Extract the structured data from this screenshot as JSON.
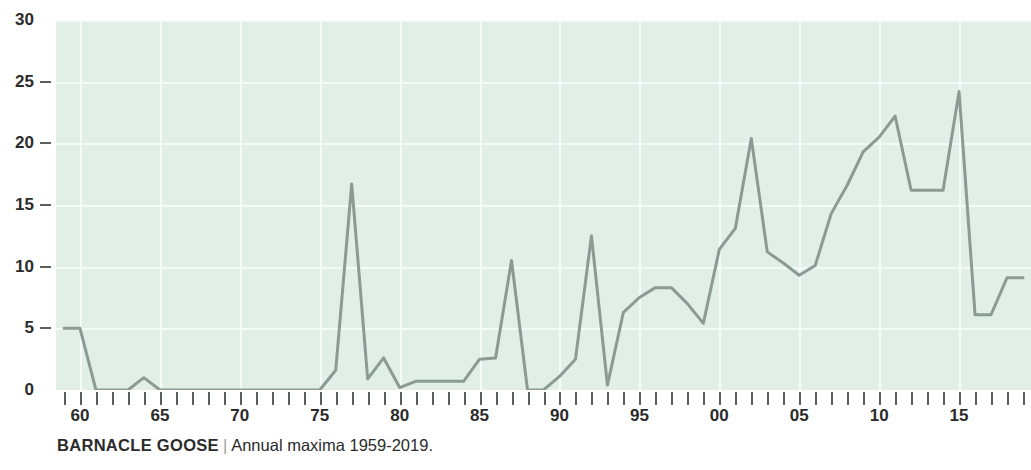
{
  "caption": {
    "species": "BARNACLE GOOSE",
    "separator": "|",
    "description": "Annual maxima 1959-2019."
  },
  "colors": {
    "plot_background": "#e1efe7",
    "gridline": "#f4faf6",
    "series_line": "#8b9b94",
    "axis_text": "#2b2b2b",
    "tick_mark": "#5a615d",
    "page_background": "#ffffff"
  },
  "chart_data": {
    "type": "line",
    "title": "BARNACLE GOOSE",
    "subtitle": "Annual maxima 1959-2019.",
    "xlabel": "",
    "ylabel": "",
    "xlim": [
      1958.5,
      2019.5
    ],
    "ylim": [
      0,
      30
    ],
    "yticks": [
      0,
      5,
      10,
      15,
      20,
      25,
      30
    ],
    "ytick_labels": [
      "0",
      "5",
      "10",
      "15",
      "20",
      "25",
      "30"
    ],
    "xticks": [
      1960,
      1965,
      1970,
      1975,
      1980,
      1985,
      1990,
      1995,
      2000,
      2005,
      2010,
      2015
    ],
    "xtick_labels": [
      "60",
      "65",
      "70",
      "75",
      "80",
      "85",
      "90",
      "95",
      "00",
      "05",
      "10",
      "15"
    ],
    "xtick_minor_every": 1,
    "grid": true,
    "grid_axis": "both",
    "legend": false,
    "legend_position": "none",
    "x": [
      1959,
      1960,
      1961,
      1962,
      1963,
      1964,
      1965,
      1966,
      1967,
      1968,
      1969,
      1970,
      1971,
      1972,
      1973,
      1974,
      1975,
      1976,
      1977,
      1978,
      1979,
      1980,
      1981,
      1982,
      1983,
      1984,
      1985,
      1986,
      1987,
      1988,
      1989,
      1990,
      1991,
      1992,
      1993,
      1994,
      1995,
      1996,
      1997,
      1998,
      1999,
      2000,
      2001,
      2002,
      2003,
      2004,
      2005,
      2006,
      2007,
      2008,
      2009,
      2010,
      2011,
      2012,
      2013,
      2014,
      2015,
      2016,
      2017,
      2018,
      2019
    ],
    "values": [
      5.0,
      5.0,
      0.0,
      0.0,
      0.0,
      1.0,
      0.0,
      0.0,
      0.0,
      0.0,
      0.0,
      0.0,
      0.0,
      0.0,
      0.0,
      0.0,
      0.0,
      1.6,
      16.7,
      0.9,
      2.6,
      0.2,
      0.7,
      0.7,
      0.7,
      0.7,
      2.5,
      2.6,
      10.5,
      0.0,
      0.0,
      1.1,
      2.5,
      12.5,
      0.4,
      6.3,
      7.5,
      8.3,
      8.3,
      7.0,
      5.4,
      11.4,
      13.1,
      20.4,
      11.2,
      10.3,
      9.3,
      10.1,
      14.3,
      16.6,
      19.3,
      20.5,
      22.2,
      16.2,
      16.2,
      16.2,
      24.2,
      6.1,
      6.1,
      9.1,
      9.1
    ],
    "series": [
      {
        "name": "Annual maxima",
        "color": "#8b9b94",
        "values": [
          5.0,
          5.0,
          0.0,
          0.0,
          0.0,
          1.0,
          0.0,
          0.0,
          0.0,
          0.0,
          0.0,
          0.0,
          0.0,
          0.0,
          0.0,
          0.0,
          0.0,
          1.6,
          16.7,
          0.9,
          2.6,
          0.2,
          0.7,
          0.7,
          0.7,
          0.7,
          2.5,
          2.6,
          10.5,
          0.0,
          0.0,
          1.1,
          2.5,
          12.5,
          0.4,
          6.3,
          7.5,
          8.3,
          8.3,
          7.0,
          5.4,
          11.4,
          13.1,
          20.4,
          11.2,
          10.3,
          9.3,
          10.1,
          14.3,
          16.6,
          19.3,
          20.5,
          22.2,
          16.2,
          16.2,
          16.2,
          24.2,
          6.1,
          6.1,
          9.1,
          9.1
        ]
      }
    ]
  }
}
